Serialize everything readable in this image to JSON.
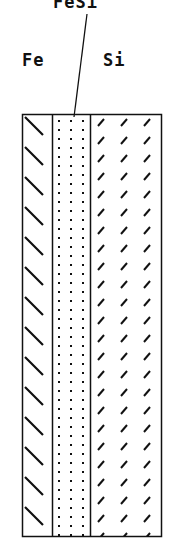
{
  "labels": {
    "fesi": "FeSi",
    "fe": "Fe",
    "si": "Si"
  },
  "layers": [
    {
      "name": "Fe",
      "pattern": "stepped-backslash"
    },
    {
      "name": "FeSi",
      "pattern": "dots"
    },
    {
      "name": "Si",
      "pattern": "forward-slashes"
    }
  ],
  "colors": {
    "ink": "#111111",
    "background": "#ffffff"
  }
}
